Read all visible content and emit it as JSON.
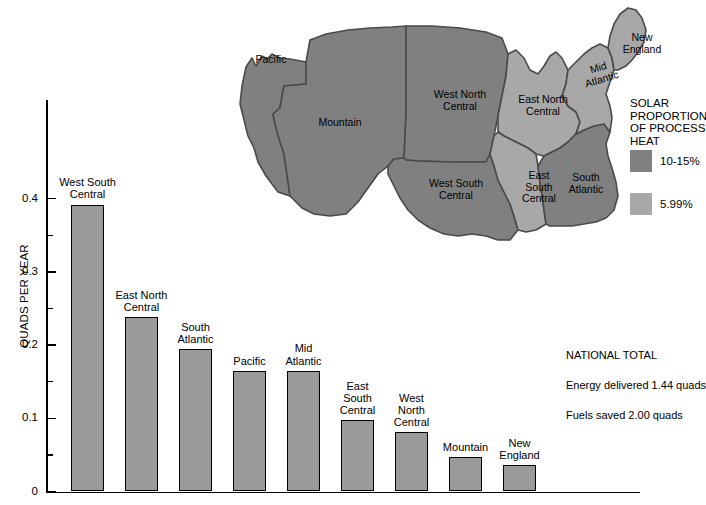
{
  "chart_data": {
    "type": "bar",
    "title": "",
    "xlabel": "",
    "ylabel": "QUADS PER YEAR",
    "ylim": [
      0,
      0.43
    ],
    "yticks": [
      "0",
      "0.1",
      "0.2",
      "0.3",
      "0.4"
    ],
    "ytick_values": [
      0,
      0.1,
      0.2,
      0.3,
      0.4
    ],
    "minor_ticks": [
      0.05,
      0.15,
      0.25,
      0.35
    ],
    "grid": false,
    "legend_position": "none",
    "bar_color": "#9a9a9a",
    "categories": [
      "West South\nCentral",
      "East North\nCentral",
      "South\nAtlantic",
      "Pacific",
      "Mid\nAtlantic",
      "East\nSouth\nCentral",
      "West\nNorth\nCentral",
      "Mountain",
      "New\nEngland"
    ],
    "values": [
      0.392,
      0.238,
      0.194,
      0.165,
      0.165,
      0.097,
      0.081,
      0.047,
      0.036
    ]
  },
  "bars": [
    {
      "label": "West South\nCentral",
      "value": 0.392
    },
    {
      "label": "East North\nCentral",
      "value": 0.238
    },
    {
      "label": "South\nAtlantic",
      "value": 0.194
    },
    {
      "label": "Pacific",
      "value": 0.165
    },
    {
      "label": "Mid\nAtlantic",
      "value": 0.165
    },
    {
      "label": "East\nSouth\nCentral",
      "value": 0.097
    },
    {
      "label": "West\nNorth\nCentral",
      "value": 0.081
    },
    {
      "label": "Mountain",
      "value": 0.047
    },
    {
      "label": "New\nEngland",
      "value": 0.036
    }
  ],
  "axis": {
    "y_title": "QUADS PER YEAR",
    "y_labels": [
      "0.4",
      "0.3",
      "0.2",
      "0.1",
      "0"
    ]
  },
  "map": {
    "regions": [
      {
        "name": "Pacific",
        "label": "Pacific",
        "shade": "dark"
      },
      {
        "name": "Mountain",
        "label": "Mountain",
        "shade": "dark"
      },
      {
        "name": "West North Central",
        "label": "West North\nCentral",
        "shade": "dark"
      },
      {
        "name": "West South Central",
        "label": "West South\nCentral",
        "shade": "dark"
      },
      {
        "name": "East North Central",
        "label": "East North\nCentral",
        "shade": "light"
      },
      {
        "name": "East South Central",
        "label": "East\nSouth\nCentral",
        "shade": "light"
      },
      {
        "name": "South Atlantic",
        "label": "South\nAtlantic",
        "shade": "dark"
      },
      {
        "name": "Mid Atlantic",
        "label": "Mid\nAtlantic",
        "shade": "light"
      },
      {
        "name": "New England",
        "label": "New\nEngland",
        "shade": "light"
      }
    ],
    "colors": {
      "dark": "#808080",
      "light": "#a8a8a8",
      "border": "#4a4a4a"
    }
  },
  "legend": {
    "title": "SOLAR\nPROPORTION\nOF PROCESS\nHEAT",
    "items": [
      {
        "label": "10-15%",
        "color": "#808080"
      },
      {
        "label": "5.99%",
        "color": "#a8a8a8"
      }
    ]
  },
  "totals": {
    "heading": "NATIONAL TOTAL",
    "line1": "Energy delivered 1.44 quads",
    "line2": "Fuels saved 2.00 quads"
  }
}
